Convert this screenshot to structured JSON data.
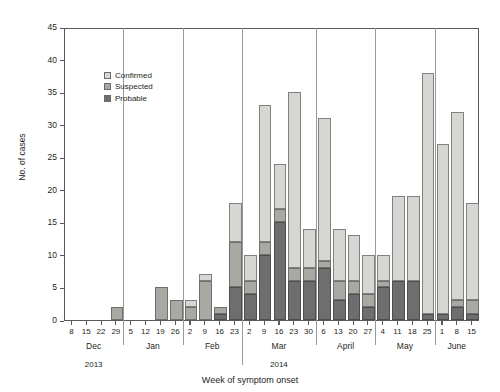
{
  "figure": {
    "clipped_title": "",
    "xlabel": "Week of symptom onset",
    "ylabel": "No. of cases"
  },
  "legend": {
    "items": [
      {
        "label": "Confirmed",
        "key": "confirmed",
        "color": "#d6d6d2"
      },
      {
        "label": "Suspected",
        "key": "suspected",
        "color": "#a9a9a4"
      },
      {
        "label": "Probable",
        "key": "probable",
        "color": "#6e6e6e"
      }
    ]
  },
  "chart_data": {
    "type": "bar",
    "title": "",
    "xlabel": "Week of symptom onset",
    "ylabel": "No. of cases",
    "ylim": [
      0,
      45
    ],
    "ytick_step": 5,
    "yticks": [
      0,
      5,
      10,
      15,
      20,
      25,
      30,
      35,
      40,
      45
    ],
    "grid": false,
    "stacked": true,
    "legend_position": "upper-left-inside",
    "categories": [
      "Dec 8",
      "Dec 15",
      "Dec 22",
      "Dec 29",
      "Jan 5",
      "Jan 12",
      "Jan 19",
      "Jan 26",
      "Feb 2",
      "Feb 9",
      "Feb 16",
      "Feb 23",
      "Mar 2",
      "Mar 9",
      "Mar 16",
      "Mar 23",
      "Mar 30",
      "April 6",
      "April 13",
      "April 20",
      "April 27",
      "May 4",
      "May 11",
      "May 18",
      "May 25",
      "June 1",
      "June 8",
      "June 15"
    ],
    "tick_labels": [
      "8",
      "15",
      "22",
      "29",
      "5",
      "12",
      "19",
      "26",
      "2",
      "9",
      "16",
      "23",
      "2",
      "9",
      "16",
      "23",
      "30",
      "6",
      "13",
      "20",
      "27",
      "4",
      "11",
      "18",
      "25",
      "1",
      "8",
      "15"
    ],
    "months": [
      {
        "name": "Dec",
        "year": "2013",
        "start_index": 0,
        "count": 4
      },
      {
        "name": "Jan",
        "year": "",
        "start_index": 4,
        "count": 4
      },
      {
        "name": "Feb",
        "year": "",
        "start_index": 8,
        "count": 4
      },
      {
        "name": "Mar",
        "year": "2014",
        "start_index": 12,
        "count": 5
      },
      {
        "name": "April",
        "year": "",
        "start_index": 17,
        "count": 4
      },
      {
        "name": "May",
        "year": "",
        "start_index": 21,
        "count": 4
      },
      {
        "name": "June",
        "year": "",
        "start_index": 25,
        "count": 3
      }
    ],
    "series": [
      {
        "name": "Probable",
        "key": "probable",
        "color": "#6e6e6e",
        "values": [
          0,
          0,
          0,
          0,
          0,
          0,
          0,
          0,
          0,
          0,
          1,
          5,
          4,
          10,
          15,
          6,
          6,
          8,
          3,
          4,
          2,
          5,
          6,
          6,
          1,
          1,
          2,
          1
        ]
      },
      {
        "name": "Suspected",
        "key": "suspected",
        "color": "#a9a9a4",
        "values": [
          0,
          0,
          0,
          2,
          0,
          0,
          5,
          3,
          2,
          6,
          1,
          7,
          2,
          2,
          2,
          2,
          2,
          1,
          3,
          2,
          2,
          1,
          0,
          0,
          0,
          0,
          1,
          2
        ]
      },
      {
        "name": "Confirmed",
        "key": "confirmed",
        "color": "#d6d6d2",
        "values": [
          0,
          0,
          0,
          0,
          0,
          0,
          0,
          0,
          1,
          1,
          0,
          6,
          4,
          21,
          7,
          27,
          6,
          22,
          8,
          7,
          6,
          4,
          13,
          13,
          37,
          26,
          29,
          15
        ]
      }
    ],
    "totals": [
      0,
      0,
      0,
      2,
      0,
      0,
      5,
      3,
      3,
      7,
      2,
      18,
      10,
      33,
      24,
      35,
      14,
      31,
      14,
      13,
      10,
      10,
      19,
      19,
      38,
      27,
      32,
      18
    ]
  }
}
